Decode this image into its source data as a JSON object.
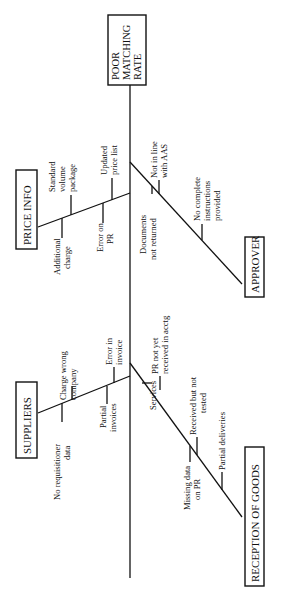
{
  "diagram": {
    "type": "fishbone",
    "orientation": "rotated-90-ccw",
    "effect": {
      "lines": [
        "POOR",
        "MATCHING",
        "RATE"
      ]
    },
    "categories": {
      "price_info": {
        "label": "PRICE INFO",
        "causes": [
          {
            "lines": [
              "Additional",
              "charge"
            ]
          },
          {
            "lines": [
              "Standard",
              "volume",
              "package"
            ]
          },
          {
            "lines": [
              "Error on",
              "PR"
            ]
          },
          {
            "lines": [
              "Updated",
              "price list"
            ]
          }
        ]
      },
      "approver": {
        "label": "APPROVER",
        "causes": [
          {
            "lines": [
              "Documents",
              "not returned"
            ]
          },
          {
            "lines": [
              "Not in line",
              "with AAS"
            ]
          },
          {
            "lines": [
              "No complete",
              "instructions",
              "provided"
            ]
          }
        ]
      },
      "suppliers": {
        "label": "SUPPLIERS",
        "causes": [
          {
            "lines": [
              "No requisitioner",
              "data"
            ]
          },
          {
            "lines": [
              "Charge wrong",
              "company"
            ]
          },
          {
            "lines": [
              "Partial",
              "invoices"
            ]
          },
          {
            "lines": [
              "Error in",
              "invoice"
            ]
          }
        ]
      },
      "reception_of_goods": {
        "label": "RECEPTION OF GOODS",
        "causes": [
          {
            "lines": [
              "Services"
            ]
          },
          {
            "lines": [
              "PR not yet",
              "received in acctg"
            ]
          },
          {
            "lines": [
              "Missing data",
              "on PR"
            ]
          },
          {
            "lines": [
              "Received but not",
              "tested"
            ]
          },
          {
            "lines": [
              "Partial deliveries"
            ]
          }
        ]
      }
    }
  }
}
